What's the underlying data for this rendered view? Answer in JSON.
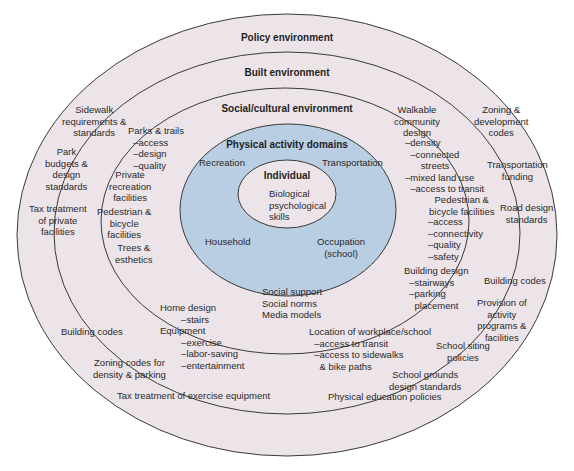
{
  "colors": {
    "ring_fill": "#ece4e8",
    "domain_fill": "#b9cde3",
    "individual_fill": "#ece4e8",
    "stroke": "#3a3a3a"
  },
  "rings": {
    "policy": {
      "title": "Policy environment"
    },
    "built": {
      "title": "Built environment"
    },
    "social": {
      "title": "Social/cultural environment"
    },
    "domains": {
      "title": "Physical activity domains"
    },
    "individual": {
      "title": "Individual"
    }
  },
  "individual": {
    "text": "Biological\npsychological\nskills"
  },
  "domains": {
    "recreation": "Recreation",
    "transportation": "Transportation",
    "household": "Household",
    "occupation": "Occupation\n(school)"
  },
  "social": {
    "items": "Social support\nSocial norms\nMedia models"
  },
  "built": {
    "parks_trails": "Parks & trails\n  –access\n  –design\n  –quality",
    "private_recreation": "Private\nrecreation\nfacilities",
    "ped_bike_left": "Pedestrian &\nbicycle\nfacilities",
    "trees": "Trees &\nesthetics",
    "home_design": "Home design\n        –stairs\nEquipment\n        –exercise\n        –labor-saving\n        –entertainment",
    "walkable": "Walkable\ncommunity\ndesign",
    "walkable_sub": "–density\n  –connected\n      streets\n–mixed land use\n  –access to transit",
    "ped_bike_right": "Pedestrian &\nbicycle facilities",
    "ped_bike_right_sub": "–access\n–connectivity\n–quality\n–safety",
    "building_design": "Building design\n  –stairways\n  –parking\n    placement",
    "workplace": "Location of workplace/school\n  –access to transit\n  –access to sidewalks\n    & bike paths"
  },
  "policy": {
    "sidewalk": "Sidewalk\nrequirements &\nstandards",
    "park_budgets": "Park\nbudgets &\ndesign\nstandards",
    "tax_private": "Tax treatment\nof private\nfacilities",
    "building_codes_left": "Building codes",
    "zoning_density": "Zoning codes for\ndensity & parking",
    "tax_exercise": "Tax treatment of exercise equipment",
    "zoning_dev": "Zoning &\ndevelopment\ncodes",
    "transport_funding": "Transportation\nfunding",
    "road_design": "Road design\nstandards",
    "building_codes_right": "Building codes",
    "provision": "Provision of\nactivity\nprograms &\nfacilities",
    "school_siting": "School siting\npolicies",
    "school_grounds": "School grounds\ndesign standards",
    "pe_policies": "Physical education policies"
  }
}
